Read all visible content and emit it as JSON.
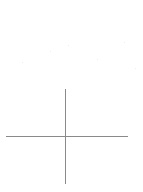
{
  "canvas": {
    "background": "#ffffff",
    "width": 143,
    "height": 192
  },
  "crosshair": {
    "color": "#8a8a8a",
    "horizontal": {
      "x1": 6,
      "x2": 128,
      "y": 136
    },
    "vertical": {
      "x": 65,
      "y1": 89,
      "y2": 184
    }
  },
  "specks": [
    {
      "x": 50,
      "y": 51
    },
    {
      "x": 68,
      "y": 45
    },
    {
      "x": 97,
      "y": 59
    },
    {
      "x": 124,
      "y": 42
    },
    {
      "x": 22,
      "y": 62
    },
    {
      "x": 135,
      "y": 68
    }
  ]
}
